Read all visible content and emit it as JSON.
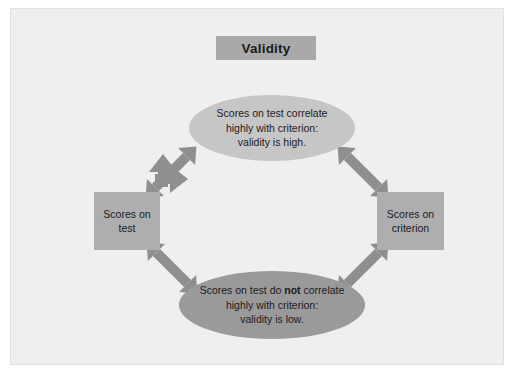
{
  "figure": {
    "title_box": {
      "label": "Validity"
    },
    "nodes": {
      "top_ellipse": {
        "line1": "Scores on test correlate",
        "line2": "highly with criterion:",
        "line3": "validity is high.",
        "fill": "#c6c6c7",
        "shape": "ellipse"
      },
      "bottom_ellipse": {
        "line1_pre": "Scores on test do ",
        "line1_bold": "not",
        "line1_post": " correlate",
        "line2": "highly with criterion:",
        "line3": "validity is low.",
        "fill": "#9a9a9b",
        "shape": "ellipse"
      },
      "left_box": {
        "line1": "Scores on",
        "line2": "test",
        "fill": "#aeaeb0",
        "shape": "rectangle"
      },
      "right_box": {
        "line1": "Scores on",
        "line2": "criterion",
        "fill": "#aeaeb0",
        "shape": "rectangle"
      }
    },
    "arrows": [
      {
        "name": "arrow-top-left",
        "direction": "double-headed-diagonal-ne-sw",
        "from": "left_box",
        "to": "top_ellipse"
      },
      {
        "name": "arrow-top-right",
        "direction": "double-headed-diagonal-nw-se",
        "from": "top_ellipse",
        "to": "right_box"
      },
      {
        "name": "arrow-bottom-left",
        "direction": "double-headed-diagonal-nw-se",
        "from": "left_box",
        "to": "bottom_ellipse"
      },
      {
        "name": "arrow-bottom-right",
        "direction": "double-headed-diagonal-ne-sw",
        "from": "bottom_ellipse",
        "to": "right_box"
      }
    ],
    "colors": {
      "panel_background": "#efeff0",
      "page_background": "#ffffff",
      "title_fill": "#a9a9aa",
      "arrow_fill": "#8f8f91",
      "text": "#1b1b1b"
    }
  }
}
